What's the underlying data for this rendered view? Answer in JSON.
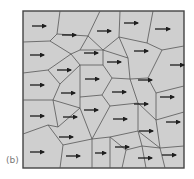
{
  "figure": {
    "panel_label": "(b)",
    "colors": {
      "cell_fill": "#cfcfcf",
      "edge": "#555555",
      "frame": "#444444",
      "arrow": "#1e1e1e"
    },
    "frame": {
      "x": 23,
      "y": 11,
      "w": 161,
      "h": 157
    },
    "edges": [
      "M60,11 L57,34",
      "M23,42 L50,41",
      "M57,34 L50,41",
      "M57,34 L88,36",
      "M100,11 L88,36",
      "M88,36 L80,50",
      "M50,41 L71,54",
      "M80,50 L71,54",
      "M80,50 L103,50",
      "M88,36 L103,50",
      "M120,11 L119,37",
      "M103,50 L119,37",
      "M119,37 L147,43",
      "M153,11 L147,43",
      "M147,43 L162,50",
      "M162,50 L184,46",
      "M23,73 L48,70",
      "M48,70 L71,54",
      "M71,54 L80,65",
      "M80,65 L103,65",
      "M103,65 L103,50",
      "M103,50 L128,58",
      "M128,58 L119,37",
      "M128,58 L130,79",
      "M48,70 L60,84",
      "M60,84 L80,65",
      "M80,65 L80,97",
      "M60,84 L53,100",
      "M103,65 L112,78",
      "M112,78 L130,79",
      "M112,78 L102,95",
      "M102,95 L80,97",
      "M130,79 L148,78",
      "M148,78 L162,50",
      "M148,78 L156,93",
      "M156,93 L184,86",
      "M23,100 L53,100",
      "M53,100 L80,108",
      "M80,108 L80,97",
      "M102,95 L110,106",
      "M110,106 L138,103",
      "M138,103 L130,79",
      "M138,103 L156,120",
      "M156,120 L156,93",
      "M156,120 L184,112",
      "M53,100 L58,127",
      "M58,127 L80,108",
      "M80,108 L92,139",
      "M92,139 L110,106",
      "M23,134 L48,125",
      "M48,125 L58,127",
      "M48,125 L63,145",
      "M63,145 L92,139",
      "M92,139 L110,137",
      "M110,137 L138,131",
      "M138,131 L138,103",
      "M138,131 L160,148",
      "M160,148 L156,120",
      "M160,148 L184,146",
      "M63,145 L60,168",
      "M92,139 L92,168",
      "M110,137 L110,168",
      "M110,137 L126,150",
      "M126,150 L142,146",
      "M142,146 L138,131",
      "M126,150 L122,168",
      "M142,146 L160,148",
      "M142,146 L146,168",
      "M160,148 L165,168"
    ],
    "arrows": [
      {
        "x1": 32,
        "y1": 26,
        "x2": 46
      },
      {
        "x1": 62,
        "y1": 35,
        "x2": 76
      },
      {
        "x1": 97,
        "y1": 31,
        "x2": 111
      },
      {
        "x1": 124,
        "y1": 23,
        "x2": 138
      },
      {
        "x1": 155,
        "y1": 29,
        "x2": 170
      },
      {
        "x1": 30,
        "y1": 55,
        "x2": 44
      },
      {
        "x1": 84,
        "y1": 53,
        "x2": 98
      },
      {
        "x1": 134,
        "y1": 51,
        "x2": 148
      },
      {
        "x1": 107,
        "y1": 62,
        "x2": 121
      },
      {
        "x1": 57,
        "y1": 70,
        "x2": 71
      },
      {
        "x1": 170,
        "y1": 65,
        "x2": 184
      },
      {
        "x1": 30,
        "y1": 85,
        "x2": 44
      },
      {
        "x1": 85,
        "y1": 79,
        "x2": 99
      },
      {
        "x1": 138,
        "y1": 80,
        "x2": 152
      },
      {
        "x1": 61,
        "y1": 93,
        "x2": 75
      },
      {
        "x1": 112,
        "y1": 92,
        "x2": 126
      },
      {
        "x1": 160,
        "y1": 97,
        "x2": 174
      },
      {
        "x1": 30,
        "y1": 116,
        "x2": 44
      },
      {
        "x1": 63,
        "y1": 117,
        "x2": 77
      },
      {
        "x1": 84,
        "y1": 110,
        "x2": 98
      },
      {
        "x1": 113,
        "y1": 119,
        "x2": 127
      },
      {
        "x1": 134,
        "y1": 104,
        "x2": 148
      },
      {
        "x1": 166,
        "y1": 122,
        "x2": 180
      },
      {
        "x1": 59,
        "y1": 137,
        "x2": 73
      },
      {
        "x1": 139,
        "y1": 131,
        "x2": 153
      },
      {
        "x1": 30,
        "y1": 152,
        "x2": 44
      },
      {
        "x1": 66,
        "y1": 156,
        "x2": 80
      },
      {
        "x1": 95,
        "y1": 153,
        "x2": 106
      },
      {
        "x1": 115,
        "y1": 147,
        "x2": 129
      },
      {
        "x1": 138,
        "y1": 158,
        "x2": 152
      },
      {
        "x1": 162,
        "y1": 155,
        "x2": 176
      }
    ]
  }
}
